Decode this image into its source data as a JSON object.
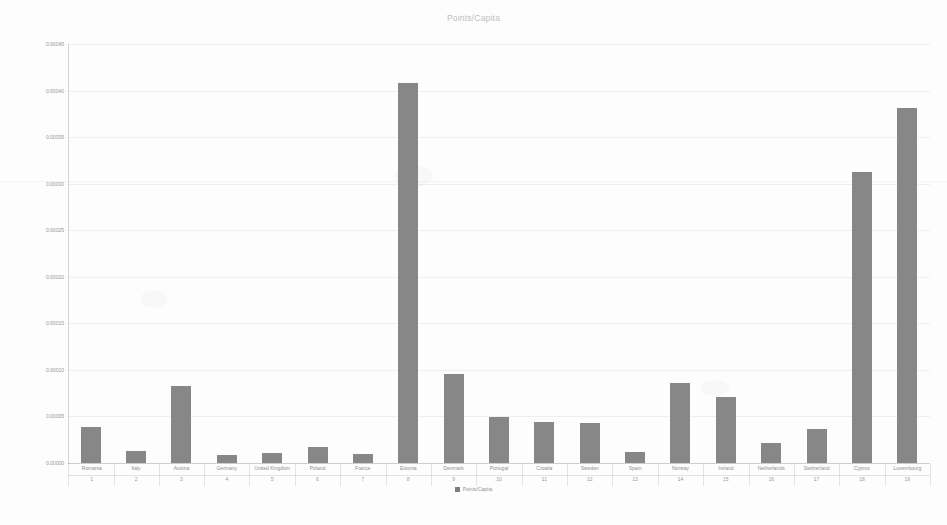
{
  "chart_data": {
    "type": "bar",
    "title": "Points/Capita",
    "xlabel": "",
    "ylabel": "",
    "ylim": [
      0,
      0.00045
    ],
    "ytick_labels": [
      "0.00045",
      "0.00040",
      "0.00035",
      "0.00030",
      "0.00025",
      "0.00020",
      "0.00015",
      "0.00010",
      "0.00005",
      "0.00000"
    ],
    "ytick_values": [
      0.00045,
      0.0004,
      0.00035,
      0.0003,
      0.00025,
      0.0002,
      0.00015,
      0.0001,
      5e-05,
      0.0
    ],
    "grid": true,
    "legend": [
      "Points/Capita"
    ],
    "legend_position": "bottom",
    "categories": [
      "Romania",
      "Italy",
      "Austria",
      "Germany",
      "United Kingdom",
      "Poland",
      "France",
      "Estonia",
      "Denmark",
      "Portugal",
      "Croatia",
      "Sweden",
      "Spain",
      "Norway",
      "Ireland",
      "Netherlands",
      "Switzerland",
      "Cyprus",
      "Luxembourg"
    ],
    "ranks": [
      "1",
      "2",
      "3",
      "4",
      "5",
      "6",
      "7",
      "8",
      "9",
      "10",
      "11",
      "12",
      "13",
      "14",
      "15",
      "16",
      "17",
      "18",
      "19"
    ],
    "series": [
      {
        "name": "Points/Capita",
        "values": [
          3.9e-05,
          1.3e-05,
          8.3e-05,
          9e-06,
          1.05e-05,
          1.75e-05,
          1e-05,
          0.000408,
          9.55e-05,
          4.95e-05,
          4.4e-05,
          4.25e-05,
          1.15e-05,
          8.6e-05,
          7.05e-05,
          2.15e-05,
          3.65e-05,
          0.0003125,
          0.000381
        ]
      }
    ]
  },
  "legend_marker": "square-swatch"
}
